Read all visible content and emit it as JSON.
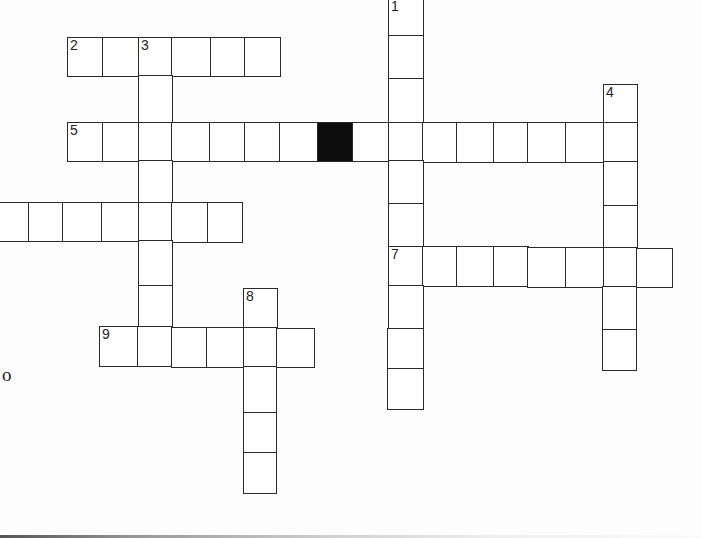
{
  "puzzle": {
    "type": "crossword",
    "stray_text": "o",
    "colors": {
      "line": "#2a2a2a",
      "black_cell": "#0c0c0c",
      "background": "#fdfdfd"
    },
    "cells": [
      {
        "x": 388,
        "y": -2,
        "w": 36,
        "h": 39,
        "num": "1"
      },
      {
        "x": 388,
        "y": 35,
        "w": 36,
        "h": 45
      },
      {
        "x": 388,
        "y": 78,
        "w": 36,
        "h": 46
      },
      {
        "x": 67,
        "y": 37,
        "w": 37,
        "h": 40,
        "num": "2"
      },
      {
        "x": 102,
        "y": 37,
        "w": 38,
        "h": 40
      },
      {
        "x": 138,
        "y": 37,
        "w": 35,
        "h": 40,
        "num": "3"
      },
      {
        "x": 171,
        "y": 37,
        "w": 41,
        "h": 40
      },
      {
        "x": 210,
        "y": 37,
        "w": 36,
        "h": 40
      },
      {
        "x": 244,
        "y": 37,
        "w": 37,
        "h": 40
      },
      {
        "x": 138,
        "y": 75,
        "w": 35,
        "h": 48
      },
      {
        "x": 603,
        "y": 84,
        "w": 35,
        "h": 40,
        "num": "4"
      },
      {
        "x": 67,
        "y": 122,
        "w": 37,
        "h": 40,
        "num": "5"
      },
      {
        "x": 102,
        "y": 122,
        "w": 38,
        "h": 40
      },
      {
        "x": 138,
        "y": 122,
        "w": 35,
        "h": 40
      },
      {
        "x": 171,
        "y": 122,
        "w": 40,
        "h": 40
      },
      {
        "x": 209,
        "y": 122,
        "w": 37,
        "h": 40
      },
      {
        "x": 244,
        "y": 122,
        "w": 37,
        "h": 40
      },
      {
        "x": 279,
        "y": 122,
        "w": 40,
        "h": 40
      },
      {
        "x": 317,
        "y": 122,
        "w": 37,
        "h": 40,
        "black": true
      },
      {
        "x": 352,
        "y": 122,
        "w": 38,
        "h": 40
      },
      {
        "x": 388,
        "y": 122,
        "w": 36,
        "h": 40
      },
      {
        "x": 422,
        "y": 122,
        "w": 36,
        "h": 41
      },
      {
        "x": 456,
        "y": 122,
        "w": 39,
        "h": 41
      },
      {
        "x": 493,
        "y": 122,
        "w": 36,
        "h": 41
      },
      {
        "x": 527,
        "y": 122,
        "w": 40,
        "h": 41
      },
      {
        "x": 565,
        "y": 122,
        "w": 40,
        "h": 41
      },
      {
        "x": 603,
        "y": 122,
        "w": 35,
        "h": 41
      },
      {
        "x": 388,
        "y": 160,
        "w": 36,
        "h": 45
      },
      {
        "x": 603,
        "y": 161,
        "w": 35,
        "h": 46
      },
      {
        "x": 138,
        "y": 160,
        "w": 35,
        "h": 44
      },
      {
        "x": -3,
        "y": 202,
        "w": 33,
        "h": 40
      },
      {
        "x": 28,
        "y": 202,
        "w": 36,
        "h": 40
      },
      {
        "x": 62,
        "y": 202,
        "w": 41,
        "h": 40
      },
      {
        "x": 101,
        "y": 202,
        "w": 39,
        "h": 40
      },
      {
        "x": 138,
        "y": 202,
        "w": 35,
        "h": 40
      },
      {
        "x": 171,
        "y": 202,
        "w": 38,
        "h": 41
      },
      {
        "x": 207,
        "y": 202,
        "w": 36,
        "h": 41
      },
      {
        "x": 388,
        "y": 203,
        "w": 36,
        "h": 45
      },
      {
        "x": 603,
        "y": 205,
        "w": 35,
        "h": 44
      },
      {
        "x": 138,
        "y": 240,
        "w": 35,
        "h": 47
      },
      {
        "x": 388,
        "y": 246,
        "w": 36,
        "h": 41,
        "num": "7"
      },
      {
        "x": 422,
        "y": 246,
        "w": 36,
        "h": 41
      },
      {
        "x": 456,
        "y": 246,
        "w": 39,
        "h": 41
      },
      {
        "x": 493,
        "y": 246,
        "w": 36,
        "h": 41
      },
      {
        "x": 527,
        "y": 247,
        "w": 40,
        "h": 41
      },
      {
        "x": 565,
        "y": 247,
        "w": 40,
        "h": 41
      },
      {
        "x": 603,
        "y": 247,
        "w": 35,
        "h": 41
      },
      {
        "x": 636,
        "y": 248,
        "w": 37,
        "h": 40
      },
      {
        "x": 138,
        "y": 285,
        "w": 35,
        "h": 42
      },
      {
        "x": 243,
        "y": 288,
        "w": 35,
        "h": 40,
        "num": "8"
      },
      {
        "x": 388,
        "y": 285,
        "w": 36,
        "h": 45
      },
      {
        "x": 602,
        "y": 286,
        "w": 35,
        "h": 45
      },
      {
        "x": 99,
        "y": 326,
        "w": 40,
        "h": 41,
        "num": "9"
      },
      {
        "x": 137,
        "y": 326,
        "w": 36,
        "h": 41
      },
      {
        "x": 171,
        "y": 327,
        "w": 37,
        "h": 41
      },
      {
        "x": 206,
        "y": 327,
        "w": 39,
        "h": 41
      },
      {
        "x": 243,
        "y": 327,
        "w": 35,
        "h": 41
      },
      {
        "x": 276,
        "y": 328,
        "w": 39,
        "h": 40
      },
      {
        "x": 602,
        "y": 329,
        "w": 35,
        "h": 42
      },
      {
        "x": 387,
        "y": 328,
        "w": 37,
        "h": 42
      },
      {
        "x": 387,
        "y": 368,
        "w": 37,
        "h": 42
      },
      {
        "x": 243,
        "y": 366,
        "w": 34,
        "h": 48
      },
      {
        "x": 243,
        "y": 412,
        "w": 34,
        "h": 42
      },
      {
        "x": 243,
        "y": 452,
        "w": 34,
        "h": 42
      }
    ]
  }
}
